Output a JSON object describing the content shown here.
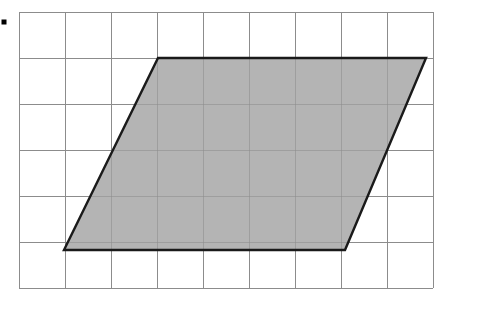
{
  "canvas": {
    "width": 491,
    "height": 311,
    "background_color": "#ffffff"
  },
  "bullet": {
    "name": "bullet-point-marker",
    "x": 4,
    "y": 22,
    "size": 5,
    "color": "#000000"
  },
  "grid": {
    "origin_x": 19,
    "origin_y": 12,
    "cell_size": 46,
    "columns": 9,
    "rows": 6,
    "line_color": "#8d8d8d",
    "right_edge": 433,
    "bottom_edge": 288
  },
  "shape": {
    "type": "parallelogram",
    "label": "shaded-parallelogram",
    "fill_color": "#b4b4b4",
    "outline_color": "#1a1a1a",
    "outline_width": 2.4,
    "vertices": [
      {
        "name": "top-left",
        "x": 158,
        "y": 58
      },
      {
        "name": "top-right",
        "x": 426,
        "y": 58
      },
      {
        "name": "bottom-right",
        "x": 345,
        "y": 250
      },
      {
        "name": "bottom-left",
        "x": 64,
        "y": 250
      }
    ],
    "points_attr": "158,58 426,58 345,250 64,250",
    "base_units": 6,
    "height_units": 4,
    "area_units": 24
  },
  "chart_data": {
    "type": "scatter",
    "title": "",
    "xlabel": "",
    "ylabel": "",
    "grid": true,
    "legend": "none",
    "unit_cell_px": 46,
    "grid_columns": 9,
    "grid_rows": 6,
    "polygon_units": [
      {
        "x": 3,
        "y": 1
      },
      {
        "x": 8.85,
        "y": 1
      },
      {
        "x": 7.1,
        "y": 5.2
      },
      {
        "x": 1,
        "y": 5.2
      }
    ],
    "series": [
      {
        "name": "parallelogram-vertices-px",
        "x": [
          158,
          426,
          345,
          64
        ],
        "y": [
          58,
          58,
          250,
          250
        ]
      }
    ]
  }
}
